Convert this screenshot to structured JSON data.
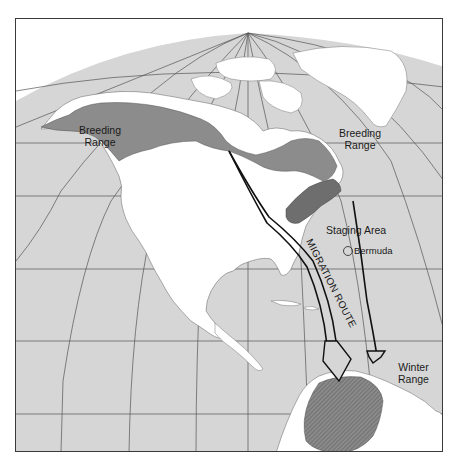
{
  "map": {
    "title": "Blackpoll Warbler migration map",
    "colors": {
      "ocean": "#d6d6d6",
      "land": "#ffffff",
      "breeding_range": "#8c8c8c",
      "staging_area": "#6e6e6e",
      "winter_range": "#7a7a7a",
      "graticule": "#555555",
      "route_line": "#111111",
      "frame": "#3a3a3a"
    },
    "labels": {
      "breeding_range_west": [
        "Breeding",
        "Range"
      ],
      "breeding_range_east": [
        "Breeding",
        "Range"
      ],
      "staging_area": "Staging Area",
      "bermuda": "Bermuda",
      "migration_route": "MIGRATION ROUTE",
      "winter_range": [
        "Winter",
        "Range"
      ]
    },
    "legend_items": [
      {
        "name": "Breeding Range",
        "region": "Alaska / Canada boreal belt"
      },
      {
        "name": "Staging Area",
        "region": "US Northeast coast"
      },
      {
        "name": "Winter Range",
        "region": "Northern South America"
      },
      {
        "name": "Migration Route",
        "region": "Two arrows from Canada/New England over Atlantic to South America"
      },
      {
        "name": "Bermuda",
        "region": "Circled point in Atlantic"
      }
    ]
  }
}
